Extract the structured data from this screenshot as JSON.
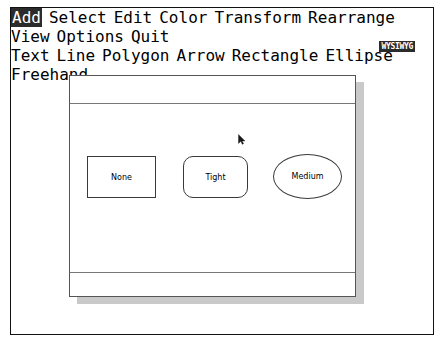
{
  "app": {
    "logo_label": "WYSIWYG"
  },
  "menubar": {
    "row1": [
      {
        "label": "Add",
        "selected": true
      },
      {
        "label": "Select",
        "selected": false
      },
      {
        "label": "Edit",
        "selected": false
      },
      {
        "label": "Color",
        "selected": false
      },
      {
        "label": "Transform",
        "selected": false
      },
      {
        "label": "Rearrange",
        "selected": false
      },
      {
        "label": "View",
        "selected": false
      },
      {
        "label": "Options",
        "selected": false
      },
      {
        "label": "Quit",
        "selected": false
      }
    ],
    "row2": [
      {
        "label": "Text",
        "selected": false
      },
      {
        "label": "Line",
        "selected": false
      },
      {
        "label": "Polygon",
        "selected": false
      },
      {
        "label": "Arrow",
        "selected": false
      },
      {
        "label": "Rectangle",
        "selected": false
      },
      {
        "label": "Ellipse",
        "selected": false
      },
      {
        "label": "Freehand",
        "selected": false
      }
    ]
  },
  "document_window": {
    "top_strip_text": "",
    "bottom_strip_text": "",
    "shapes": [
      {
        "name": "rectangle",
        "label": "None"
      },
      {
        "name": "rounded-rectangle",
        "label": "Tight"
      },
      {
        "name": "ellipse",
        "label": "Medium"
      }
    ]
  },
  "cursor": {
    "icon": "arrow-pointer-icon",
    "x": 229,
    "y": 126
  },
  "colors": {
    "page_background": "#ffffff",
    "ink": "#000000",
    "frame_border": "#111111",
    "window_border": "#555555",
    "window_shadow": "#c9c9c9",
    "shape_stroke": "#3a3a3a",
    "highlight_background": "#2b2b2b",
    "highlight_text": "#ffffff"
  }
}
